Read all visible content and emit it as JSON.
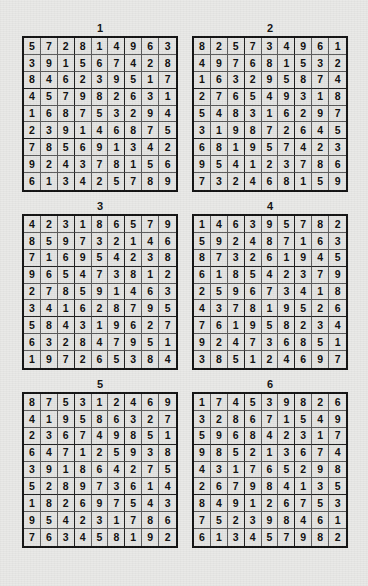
{
  "page": {
    "background_color": "#e9e9e7",
    "ink_color": "#111111",
    "cell_background": "#e4e4e2"
  },
  "puzzles": [
    {
      "title": "1",
      "rows": [
        [
          5,
          7,
          2,
          8,
          1,
          4,
          9,
          6,
          3
        ],
        [
          3,
          9,
          1,
          5,
          6,
          7,
          4,
          2,
          8
        ],
        [
          8,
          4,
          6,
          2,
          3,
          9,
          5,
          1,
          7
        ],
        [
          4,
          5,
          7,
          9,
          8,
          2,
          6,
          3,
          1
        ],
        [
          1,
          6,
          8,
          7,
          5,
          3,
          2,
          9,
          4
        ],
        [
          2,
          3,
          9,
          1,
          4,
          6,
          8,
          7,
          5
        ],
        [
          7,
          8,
          5,
          6,
          9,
          1,
          3,
          4,
          2
        ],
        [
          9,
          2,
          4,
          3,
          7,
          8,
          1,
          5,
          6
        ],
        [
          6,
          1,
          3,
          4,
          2,
          5,
          7,
          8,
          9
        ]
      ]
    },
    {
      "title": "2",
      "rows": [
        [
          8,
          2,
          5,
          7,
          3,
          4,
          9,
          6,
          1
        ],
        [
          4,
          9,
          7,
          6,
          8,
          1,
          5,
          3,
          2
        ],
        [
          1,
          6,
          3,
          2,
          9,
          5,
          8,
          7,
          4
        ],
        [
          2,
          7,
          6,
          5,
          4,
          9,
          3,
          1,
          8
        ],
        [
          5,
          4,
          8,
          3,
          1,
          6,
          2,
          9,
          7
        ],
        [
          3,
          1,
          9,
          8,
          7,
          2,
          6,
          4,
          5
        ],
        [
          6,
          8,
          1,
          9,
          5,
          7,
          4,
          2,
          3
        ],
        [
          9,
          5,
          4,
          1,
          2,
          3,
          7,
          8,
          6
        ],
        [
          7,
          3,
          2,
          4,
          6,
          8,
          1,
          5,
          9
        ]
      ]
    },
    {
      "title": "3",
      "rows": [
        [
          4,
          2,
          3,
          1,
          8,
          6,
          5,
          7,
          9
        ],
        [
          8,
          5,
          9,
          7,
          3,
          2,
          1,
          4,
          6
        ],
        [
          7,
          1,
          6,
          9,
          5,
          4,
          2,
          3,
          8
        ],
        [
          9,
          6,
          5,
          4,
          7,
          3,
          8,
          1,
          2
        ],
        [
          2,
          7,
          8,
          5,
          9,
          1,
          4,
          6,
          3
        ],
        [
          3,
          4,
          1,
          6,
          2,
          8,
          7,
          9,
          5
        ],
        [
          5,
          8,
          4,
          3,
          1,
          9,
          6,
          2,
          7
        ],
        [
          6,
          3,
          2,
          8,
          4,
          7,
          9,
          5,
          1
        ],
        [
          1,
          9,
          7,
          2,
          6,
          5,
          3,
          8,
          4
        ]
      ]
    },
    {
      "title": "4",
      "rows": [
        [
          1,
          4,
          6,
          3,
          9,
          5,
          7,
          8,
          2
        ],
        [
          5,
          9,
          2,
          4,
          8,
          7,
          1,
          6,
          3
        ],
        [
          8,
          7,
          3,
          2,
          6,
          1,
          9,
          4,
          5
        ],
        [
          6,
          1,
          8,
          5,
          4,
          2,
          3,
          7,
          9
        ],
        [
          2,
          5,
          9,
          6,
          7,
          3,
          4,
          1,
          8
        ],
        [
          4,
          3,
          7,
          8,
          1,
          9,
          5,
          2,
          6
        ],
        [
          7,
          6,
          1,
          9,
          5,
          8,
          2,
          3,
          4
        ],
        [
          9,
          2,
          4,
          7,
          3,
          6,
          8,
          5,
          1
        ],
        [
          3,
          8,
          5,
          1,
          2,
          4,
          6,
          9,
          7
        ]
      ]
    },
    {
      "title": "5",
      "rows": [
        [
          8,
          7,
          5,
          3,
          1,
          2,
          4,
          6,
          9
        ],
        [
          4,
          1,
          9,
          5,
          8,
          6,
          3,
          2,
          7
        ],
        [
          2,
          3,
          6,
          7,
          4,
          9,
          8,
          5,
          1
        ],
        [
          6,
          4,
          7,
          1,
          2,
          5,
          9,
          3,
          8
        ],
        [
          3,
          9,
          1,
          8,
          6,
          4,
          2,
          7,
          5
        ],
        [
          5,
          2,
          8,
          9,
          7,
          3,
          6,
          1,
          4
        ],
        [
          1,
          8,
          2,
          6,
          9,
          7,
          5,
          4,
          3
        ],
        [
          9,
          5,
          4,
          2,
          3,
          1,
          7,
          8,
          6
        ],
        [
          7,
          6,
          3,
          4,
          5,
          8,
          1,
          9,
          2
        ]
      ]
    },
    {
      "title": "6",
      "rows": [
        [
          1,
          7,
          4,
          5,
          3,
          9,
          8,
          2,
          6
        ],
        [
          3,
          2,
          8,
          6,
          7,
          1,
          5,
          4,
          9
        ],
        [
          5,
          9,
          6,
          8,
          4,
          2,
          3,
          1,
          7
        ],
        [
          9,
          8,
          5,
          2,
          1,
          3,
          6,
          7,
          4
        ],
        [
          4,
          3,
          1,
          7,
          6,
          5,
          2,
          9,
          8
        ],
        [
          2,
          6,
          7,
          9,
          8,
          4,
          1,
          3,
          5
        ],
        [
          8,
          4,
          9,
          1,
          2,
          6,
          7,
          5,
          3
        ],
        [
          7,
          5,
          2,
          3,
          9,
          8,
          4,
          6,
          1
        ],
        [
          6,
          1,
          3,
          4,
          5,
          7,
          9,
          8,
          2
        ]
      ]
    }
  ]
}
